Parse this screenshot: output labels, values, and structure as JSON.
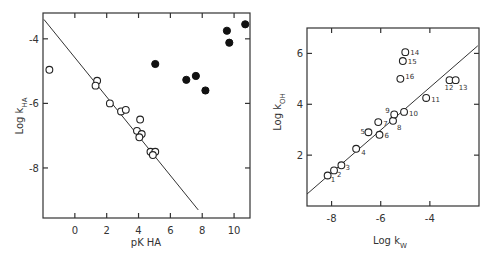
{
  "chart_data": [
    {
      "type": "scatter",
      "title": "",
      "xlabel": "pK HA",
      "xlabel_parts": {
        "main": "pK",
        "sub": "HA"
      },
      "ylabel": "Log k HA",
      "ylabel_parts": {
        "main": "Log k",
        "sub": "HA"
      },
      "xlim": [
        -2,
        11
      ],
      "ylim": [
        -9.55,
        -3.2
      ],
      "xticks": [
        0,
        2,
        4,
        6,
        8,
        10
      ],
      "xtick_labels": [
        "0",
        "2",
        "4",
        "6",
        "8",
        "10"
      ],
      "yticks": [
        -4,
        -6,
        -8
      ],
      "ytick_labels": [
        "-4",
        "-6",
        "-8"
      ],
      "grid": false,
      "series": [
        {
          "name": "open",
          "marker": "open-circle",
          "points": [
            [
              -1.6,
              -4.96
            ],
            [
              1.4,
              -5.3
            ],
            [
              1.3,
              -5.45
            ],
            [
              2.2,
              -6.0
            ],
            [
              2.9,
              -6.25
            ],
            [
              3.2,
              -6.2
            ],
            [
              4.1,
              -6.5
            ],
            [
              3.9,
              -6.85
            ],
            [
              4.2,
              -6.95
            ],
            [
              4.05,
              -7.05
            ],
            [
              4.75,
              -7.5
            ],
            [
              5.05,
              -7.5
            ],
            [
              4.9,
              -7.6
            ]
          ]
        },
        {
          "name": "filled",
          "marker": "filled-circle",
          "points": [
            [
              5.05,
              -4.78
            ],
            [
              7.0,
              -5.27
            ],
            [
              7.6,
              -5.15
            ],
            [
              8.2,
              -5.6
            ],
            [
              9.55,
              -3.75
            ],
            [
              9.7,
              -4.12
            ],
            [
              10.7,
              -3.55
            ]
          ]
        }
      ],
      "fit_line": [
        [
          -1.94,
          -3.4
        ],
        [
          7.75,
          -9.3
        ]
      ]
    },
    {
      "type": "scatter",
      "title": "",
      "xlabel": "Log k W",
      "xlabel_parts": {
        "main": "Log k",
        "sub": "W"
      },
      "ylabel": "Log k OH",
      "ylabel_parts": {
        "main": "Log k",
        "sub": "OH"
      },
      "xlim": [
        -9,
        -2
      ],
      "ylim": [
        0,
        7
      ],
      "xticks": [
        -8,
        -6,
        -4
      ],
      "xtick_labels": [
        "-8",
        "-6",
        "-4"
      ],
      "yticks": [
        2,
        4,
        6
      ],
      "ytick_labels": [
        "2",
        "4",
        "6"
      ],
      "grid": false,
      "series": [
        {
          "name": "open",
          "marker": "open-circle",
          "points": [
            {
              "label": "1",
              "x": -8.16,
              "y": 1.2
            },
            {
              "label": "2",
              "x": -7.9,
              "y": 1.4
            },
            {
              "label": "3",
              "x": -7.6,
              "y": 1.6
            },
            {
              "label": "4",
              "x": -7.0,
              "y": 2.25
            },
            {
              "label": "5",
              "x": -6.5,
              "y": 2.9
            },
            {
              "label": "6",
              "x": -6.05,
              "y": 2.8
            },
            {
              "label": "7",
              "x": -6.1,
              "y": 3.3
            },
            {
              "label": "8",
              "x": -5.5,
              "y": 3.35
            },
            {
              "label": "9",
              "x": -5.45,
              "y": 3.6
            },
            {
              "label": "10",
              "x": -5.05,
              "y": 3.7
            },
            {
              "label": "11",
              "x": -4.15,
              "y": 4.25
            },
            {
              "label": "12",
              "x": -3.2,
              "y": 4.95
            },
            {
              "label": "13",
              "x": -2.95,
              "y": 4.95
            },
            {
              "label": "14",
              "x": -5.0,
              "y": 6.05
            },
            {
              "label": "15",
              "x": -5.1,
              "y": 5.7
            },
            {
              "label": "16",
              "x": -5.2,
              "y": 5.0
            }
          ]
        }
      ],
      "fit_line": [
        [
          -9.0,
          0.47
        ],
        [
          -2.05,
          6.3
        ]
      ]
    }
  ]
}
